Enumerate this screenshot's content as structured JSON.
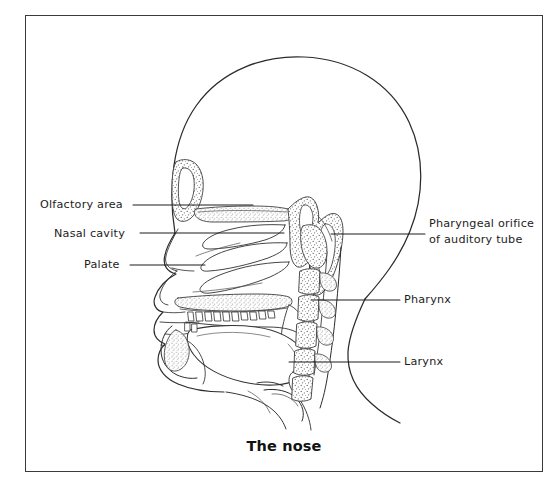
{
  "figure": {
    "caption": "The nose",
    "background_color": "#ffffff",
    "frame_color": "#3a3a3a",
    "ink_color": "#2b2b2b",
    "text_color": "#1d1d1d"
  },
  "labels": {
    "olfactory_area": "Olfactory area",
    "nasal_cavity": "Nasal cavity",
    "palate": "Palate",
    "pharyngeal_orifice_line1": "Pharyngeal orifice",
    "pharyngeal_orifice_line2": "of auditory tube",
    "pharynx": "Pharynx",
    "larynx": "Larynx"
  },
  "anatomy_parts": [
    "cranium",
    "frontal-sinus",
    "nasal-conchae",
    "nasal-cavity",
    "sphenoid-sinus",
    "hard-palate",
    "soft-palate",
    "upper-teeth",
    "lower-teeth",
    "tongue",
    "mandible",
    "pharynx",
    "larynx",
    "epiglottis",
    "cervical-vertebrae",
    "spinal-canal",
    "neck-outline",
    "face-profile"
  ]
}
